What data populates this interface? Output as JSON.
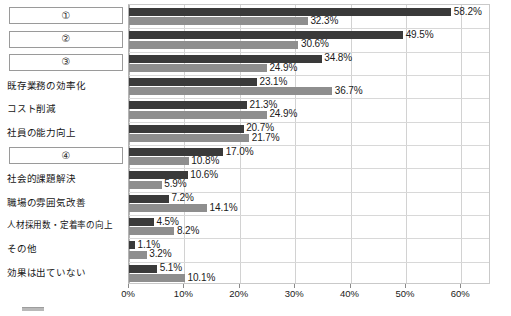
{
  "chart_data": {
    "type": "bar",
    "orientation": "horizontal",
    "title": "",
    "subtitle": "",
    "xlabel": "",
    "ylabel": "",
    "xlim": [
      0,
      65
    ],
    "xticks": [
      0,
      10,
      20,
      30,
      40,
      50,
      60
    ],
    "xtick_labels": [
      "0%",
      "10%",
      "20%",
      "30%",
      "40%",
      "50%",
      "60%"
    ],
    "grid": true,
    "grid_axis": "x",
    "legend": "",
    "legend_position": "bottom",
    "value_suffix": "%",
    "categories": [
      "①",
      "②",
      "③",
      "既存業務の効率化",
      "コスト削減",
      "社員の能力向上",
      "④",
      "社会的課題解決",
      "職場の雰囲気改善",
      "人材採用数・定着率の向上",
      "その他",
      "効果は出ていない"
    ],
    "category_redacted": [
      true,
      true,
      true,
      false,
      false,
      false,
      true,
      false,
      false,
      false,
      false,
      false
    ],
    "series": [
      {
        "name": "series-1",
        "color": "#3a3a3a",
        "values": [
          58.2,
          49.5,
          34.8,
          23.1,
          21.3,
          20.7,
          17.0,
          10.6,
          7.2,
          4.5,
          1.1,
          5.1
        ]
      },
      {
        "name": "series-2",
        "color": "#8e8e8e",
        "values": [
          32.3,
          30.6,
          24.9,
          36.7,
          24.9,
          21.7,
          10.8,
          5.9,
          14.1,
          8.2,
          3.2,
          10.1
        ]
      }
    ],
    "data_labels": [
      [
        "58.2%",
        "32.3%"
      ],
      [
        "49.5%",
        "30.6%"
      ],
      [
        "34.8%",
        "24.9%"
      ],
      [
        "23.1%",
        "36.7%"
      ],
      [
        "21.3%",
        "24.9%"
      ],
      [
        "20.7%",
        "21.7%"
      ],
      [
        "17.0%",
        "10.8%"
      ],
      [
        "10.6%",
        "5.9%"
      ],
      [
        "7.2%",
        "14.1%"
      ],
      [
        "4.5%",
        "8.2%"
      ],
      [
        "1.1%",
        "3.2%"
      ],
      [
        "5.1%",
        "10.1%"
      ]
    ]
  },
  "colors": {
    "series_1": "#3a3a3a",
    "series_2": "#8e8e8e",
    "grid": "#d2d2d2",
    "frame": "#c9c9c9",
    "text": "#1a1a1a",
    "background": "#ffffff"
  }
}
